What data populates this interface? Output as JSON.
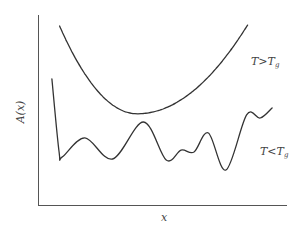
{
  "chart_data": {
    "type": "line",
    "title": "",
    "xlabel": "x",
    "ylabel": "A(x)",
    "grid": false,
    "ticks": false,
    "xlim": [
      0,
      1
    ],
    "ylim": [
      0,
      1
    ],
    "series": [
      {
        "name": "T > Tg",
        "label_main": "T",
        "label_op": ">",
        "label_var": "T",
        "label_sub": "g",
        "description": "smooth single-well (parabolic) free energy",
        "x": [
          0.087,
          0.2,
          0.3,
          0.4,
          0.485,
          0.55,
          0.65,
          0.75,
          0.85,
          0.845
        ],
        "y": [
          0.942,
          0.74,
          0.57,
          0.48,
          0.505,
          0.51,
          0.58,
          0.7,
          0.9,
          0.947
        ]
      },
      {
        "name": "T < Tg",
        "label_main": "T",
        "label_op": "<",
        "label_var": "T",
        "label_sub": "g",
        "description": "rugged multi-well free energy landscape",
        "x": [
          0.056,
          0.085,
          0.098,
          0.189,
          0.301,
          0.425,
          0.517,
          0.577,
          0.629,
          0.687,
          0.758,
          0.841,
          0.896,
          0.944
        ],
        "y": [
          0.663,
          0.279,
          0.253,
          0.353,
          0.242,
          0.437,
          0.237,
          0.289,
          0.279,
          0.379,
          0.184,
          0.474,
          0.458,
          0.511
        ]
      }
    ],
    "annotations": [
      {
        "text": "T>Tg",
        "near": "upper-right of upper curve"
      },
      {
        "text": "T<Tg",
        "near": "right of lower curve"
      }
    ]
  }
}
